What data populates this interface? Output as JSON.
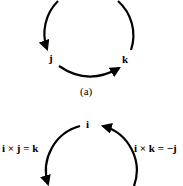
{
  "figure_a": {
    "nodes": {
      "j": "j",
      "k": "k"
    },
    "caption": "(a)"
  },
  "figure_b": {
    "nodes": {
      "i": "i"
    },
    "left_label": "i × j = k",
    "right_label": "i × k = −j"
  },
  "colors": {
    "stroke": "#000000",
    "background": "#ffffff"
  }
}
